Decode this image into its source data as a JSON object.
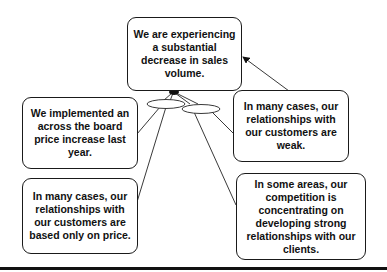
{
  "diagram": {
    "nodes": [
      {
        "id": "effect",
        "text": "We are experiencing a substantial decrease in sales volume."
      },
      {
        "id": "cause-price-increase",
        "text": "We implemented an across the board price increase last year."
      },
      {
        "id": "cause-weak-relationships",
        "text": "In many cases, our relationships with our customers are weak."
      },
      {
        "id": "cause-price-based",
        "text": "In many cases, our relationships with our customers are based only on price."
      },
      {
        "id": "cause-competition",
        "text": "In some areas, our competition is concentrating on developing strong relationships with our clients."
      }
    ],
    "edges": [
      {
        "from": "cause-price-increase",
        "to": "effect",
        "via": "and-ellipse-left"
      },
      {
        "from": "cause-price-based",
        "to": "effect",
        "via": "and-ellipse-left"
      },
      {
        "from": "cause-competition",
        "to": "effect",
        "via": "and-ellipse-right"
      },
      {
        "from": "cause-weak-relationships",
        "to": "effect",
        "via": "and-ellipse-right"
      },
      {
        "from": "cause-weak-relationships",
        "to": "effect",
        "direct": true
      }
    ]
  }
}
